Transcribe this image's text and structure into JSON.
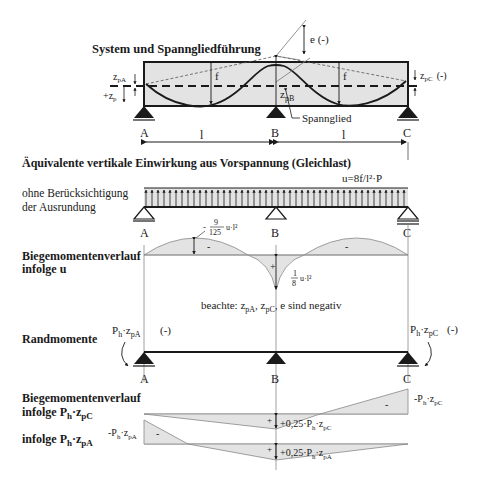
{
  "colors": {
    "fill": "#e3e3e3",
    "line": "#1a1a1a",
    "thin": "#888888"
  },
  "system": {
    "title": "System und Spanngliedführung",
    "labels": {
      "zpA": "z",
      "zpA_sub": "pA",
      "zp_plus": "+z",
      "zp_sub": "p",
      "f_left": "f",
      "f_right": "f",
      "e": "e (-)",
      "zpB": "z",
      "zpB_sub": "pB",
      "zpC": "z",
      "zpC_sub": "pC",
      "zpC_sign": "(-)",
      "spannglied": "Spannglied"
    },
    "supports": [
      "A",
      "B",
      "C"
    ],
    "span_left": "l",
    "span_right": "l"
  },
  "equivalent_load": {
    "title": "Äquivalente vertikale Einwirkung aus Vorspannung (Gleichlast)",
    "note_line1": "ohne Berücksichtigung",
    "note_line2": "der Ausrundung",
    "formula": "u=8f/l²·P",
    "supports": [
      "A",
      "B",
      "C"
    ]
  },
  "moment_u": {
    "title_line1": "Biegemomentenverlauf",
    "title_line2": "infolge u",
    "span_value_prefix": "-",
    "span_value_num": "9",
    "span_value_den": "125",
    "span_value_suffix": "u·l²",
    "support_value_num": "1",
    "support_value_den": "8",
    "support_value_suffix": "u·l²",
    "sign_span": "-",
    "sign_support": "+",
    "note": "beachte: zpA, zpC, e sind negativ"
  },
  "end_moments": {
    "title": "Randmomente",
    "left_label": "Ph·zpA",
    "left_sign": "(-)",
    "right_label": "Ph·zpC",
    "right_sign": "(-)",
    "supports": [
      "A",
      "B",
      "C"
    ]
  },
  "moment_end": {
    "title_line1": "Biegemomentenverlauf",
    "title_line2": "infolge Ph·zpC",
    "title_line3": "infolge Ph·zpA",
    "right_value": "-Ph·zpC",
    "left_value": "-Ph·zpA",
    "mid_value_C": "+0,25·Ph·zpC",
    "mid_value_A": "+0,25·Ph·zpA",
    "sign_minus": "-",
    "sign_plus": "+"
  }
}
